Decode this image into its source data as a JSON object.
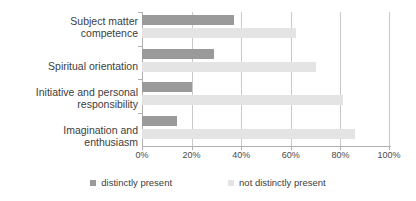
{
  "chart_data": {
    "type": "bar",
    "orientation": "horizontal",
    "title": "",
    "subtitle": "",
    "xlabel": "",
    "ylabel": "",
    "xlim": [
      0,
      100
    ],
    "grid": true,
    "legend_position": "bottom",
    "categories": [
      "Subject matter competence",
      "Spiritual orientation",
      "Initiative and personal responsibility",
      "Imagination and enthusiasm"
    ],
    "category_lines": [
      [
        "Subject matter",
        "competence"
      ],
      [
        "Spiritual orientation",
        ""
      ],
      [
        "Initiative and personal",
        "responsibility"
      ],
      [
        "Imagination and",
        "enthusiasm"
      ]
    ],
    "series": [
      {
        "name": "distinctly present",
        "color": "#9a9a9a",
        "values": [
          37,
          29,
          20,
          14
        ]
      },
      {
        "name": "not distinctly present",
        "color": "#e4e4e4",
        "values": [
          62,
          70,
          81,
          86
        ]
      }
    ],
    "xticks": [
      0,
      20,
      40,
      60,
      80,
      100
    ],
    "xtick_labels": [
      "0%",
      "20%",
      "40%",
      "60%",
      "80%",
      "100%"
    ]
  },
  "colors": {
    "series_1": "#9a9a9a",
    "series_2": "#e4e4e4",
    "gridline": "#c9c9c9",
    "axis": "#b0b0b0",
    "text": "#3d3d3d",
    "background": "#ffffff"
  }
}
